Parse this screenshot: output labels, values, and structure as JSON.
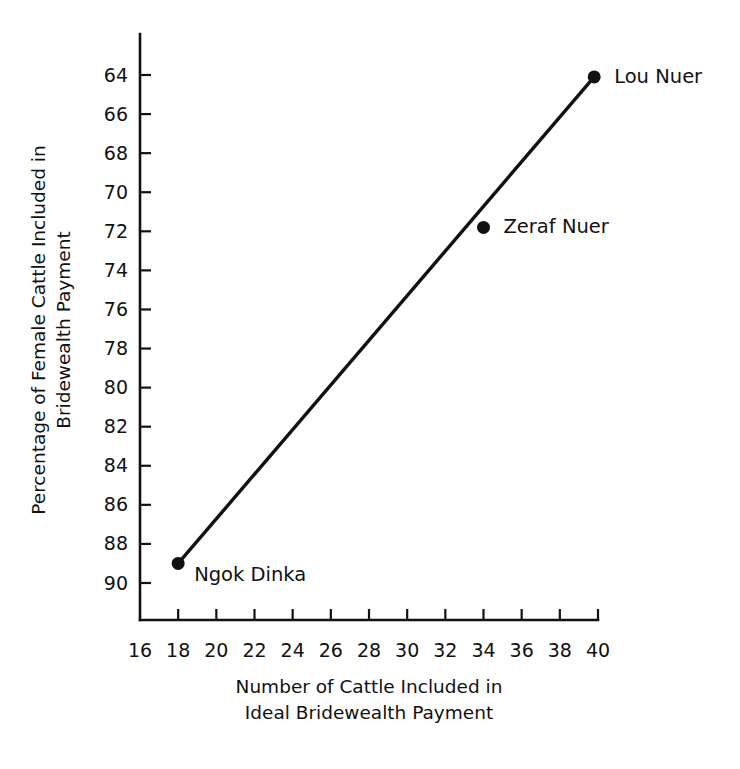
{
  "chart_data": {
    "type": "line",
    "title": "",
    "xlabel": "Number of Cattle Included in Ideal Bridewealth Payment",
    "xlabel_lines": [
      "Number of Cattle Included in",
      "Ideal Bridewealth Payment"
    ],
    "ylabel": "Percentage of Female Cattle Included in Bridewealth Payment",
    "ylabel_lines": [
      "Percentage of Female Cattle Included in",
      "Bridewealth Payment"
    ],
    "xlim": [
      16,
      40
    ],
    "ylim": [
      90,
      63
    ],
    "y_axis_inverted": true,
    "xticks": [
      16,
      18,
      20,
      22,
      24,
      26,
      28,
      30,
      32,
      34,
      36,
      38,
      40
    ],
    "xtick_labels": [
      "16",
      "18",
      "20",
      "22",
      "24",
      "26",
      "28",
      "30",
      "32",
      "34",
      "36",
      "38",
      "40"
    ],
    "yticks": [
      64,
      66,
      68,
      70,
      72,
      74,
      76,
      78,
      80,
      82,
      84,
      86,
      88,
      90
    ],
    "ytick_labels": [
      "64",
      "66",
      "68",
      "70",
      "72",
      "74",
      "76",
      "78",
      "80",
      "82",
      "84",
      "86",
      "88",
      "90"
    ],
    "grid": false,
    "legend": "none",
    "line_color": "#111111",
    "points": [
      {
        "label": "Ngok Dinka",
        "x": 18,
        "y": 89,
        "label_dx": 16,
        "label_dy": 18
      },
      {
        "label": "Zeraf Nuer",
        "x": 34,
        "y": 71.8,
        "label_dx": 20,
        "label_dy": 6
      },
      {
        "label": "Lou Nuer",
        "x": 39.8,
        "y": 64.1,
        "label_dx": 20,
        "label_dy": 6
      }
    ],
    "trend_line": {
      "from": {
        "x": 18,
        "y": 89
      },
      "to": {
        "x": 39.8,
        "y": 64.1
      }
    }
  }
}
